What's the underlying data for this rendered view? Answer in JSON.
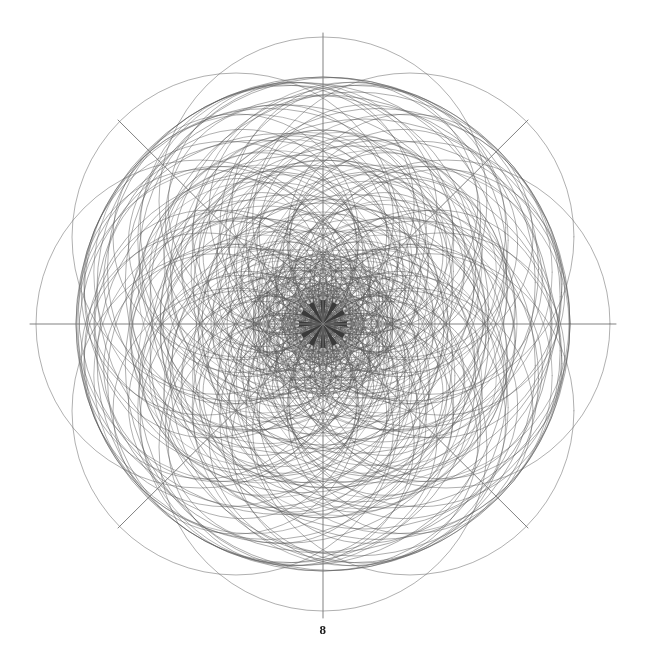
{
  "figure": {
    "caption": "8",
    "title": "",
    "background_color": "#ffffff",
    "line_color": "#555555",
    "axis_color": "#7a7a7a",
    "caption_color": "#1a1a1a"
  },
  "chart_data": {
    "type": "scatter",
    "title": "",
    "subtitle": "",
    "xlabel": "",
    "ylabel": "",
    "grid": false,
    "legend": null,
    "annotations": [
      "8"
    ],
    "center": {
      "x": 323,
      "y": 324
    },
    "outer_radius": 247,
    "xlim": [
      0,
      646
    ],
    "ylim": [
      0,
      670
    ],
    "axes": [
      {
        "name": "horizontal-axis",
        "x1": 30,
        "y1": 324,
        "x2": 616,
        "y2": 324
      },
      {
        "name": "vertical-axis",
        "x1": 323,
        "y1": 33,
        "x2": 323,
        "y2": 618
      },
      {
        "name": "diagonal-axis-nwse",
        "x1": 118,
        "y1": 120,
        "x2": 528,
        "y2": 528
      },
      {
        "name": "diagonal-axis-nesw",
        "x1": 528,
        "y1": 120,
        "x2": 118,
        "y2": 528
      }
    ],
    "rings": [
      {
        "name": "ring-1",
        "center_radius": 18,
        "count": 12,
        "circle_radius": 18,
        "phase": 0
      },
      {
        "name": "ring-2",
        "center_radius": 33,
        "count": 12,
        "circle_radius": 33,
        "phase": 15
      },
      {
        "name": "ring-3",
        "center_radius": 48,
        "count": 16,
        "circle_radius": 48,
        "phase": 0
      },
      {
        "name": "ring-4",
        "center_radius": 63,
        "count": 16,
        "circle_radius": 63,
        "phase": 11.25
      },
      {
        "name": "ring-5",
        "center_radius": 80,
        "count": 18,
        "circle_radius": 80,
        "phase": 0
      },
      {
        "name": "ring-6",
        "center_radius": 97,
        "count": 18,
        "circle_radius": 97,
        "phase": 10
      },
      {
        "name": "ring-7",
        "center_radius": 114,
        "count": 16,
        "circle_radius": 114,
        "phase": 0
      },
      {
        "name": "ring-8",
        "center_radius": 123,
        "count": 12,
        "circle_radius": 123,
        "phase": 15
      },
      {
        "name": "ring-9",
        "center_radius": 123,
        "count": 8,
        "circle_radius": 164,
        "phase": 0
      },
      {
        "name": "ring-10",
        "center_radius": 104,
        "count": 8,
        "circle_radius": 143,
        "phase": 22.5
      }
    ],
    "outline_circles": [
      {
        "name": "outer-envelope",
        "radius": 247
      },
      {
        "name": "inner-envelope",
        "radius": 229
      }
    ],
    "starburst": {
      "name": "center-starburst",
      "spokes": 12,
      "radius": 24
    },
    "values": [
      12,
      12,
      16,
      16,
      18,
      18,
      16,
      12,
      8,
      8
    ],
    "categories": [
      "ring-1",
      "ring-2",
      "ring-3",
      "ring-4",
      "ring-5",
      "ring-6",
      "ring-7",
      "ring-8",
      "ring-9",
      "ring-10"
    ]
  }
}
